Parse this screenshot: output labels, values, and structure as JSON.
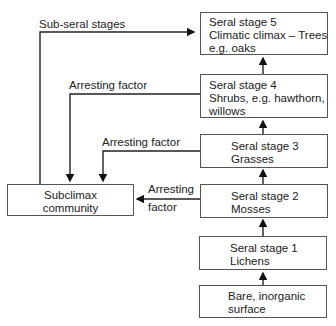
{
  "boxes": {
    "stage5": {
      "lines": [
        "Seral stage 5",
        "Climatic climax – Trees",
        "e.g. oaks"
      ]
    },
    "stage4": {
      "lines": [
        "Seral stage 4",
        "Shrubs, e.g. hawthorn,",
        "willows"
      ]
    },
    "stage3": {
      "lines": [
        "Seral stage 3",
        "Grasses"
      ]
    },
    "stage2": {
      "lines": [
        "Seral stage 2",
        "Mosses"
      ]
    },
    "stage1": {
      "lines": [
        "Seral stage 1",
        "Lichens"
      ]
    },
    "bare": {
      "lines": [
        "Bare, inorganic",
        "surface"
      ]
    },
    "subclimax": {
      "lines": [
        "Subclimax",
        "community"
      ]
    }
  },
  "labels": {
    "sub_seral": "Sub-seral stages",
    "arresting_4": "Arresting factor",
    "arresting_3": "Arresting factor",
    "arresting_2a": "Arresting",
    "arresting_2b": "factor"
  }
}
